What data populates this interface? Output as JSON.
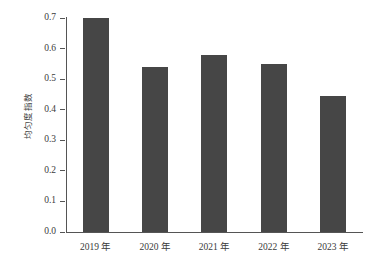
{
  "chart_data": {
    "type": "bar",
    "title": "",
    "subtitle": "",
    "xlabel": "",
    "ylabel": "均匀度指数",
    "categories": [
      "2019 年",
      "2020 年",
      "2021 年",
      "2022 年",
      "2023 年"
    ],
    "values": [
      0.7,
      0.54,
      0.58,
      0.55,
      0.445
    ],
    "series": [
      {
        "name": "均匀度指数",
        "values": [
          0.7,
          0.54,
          0.58,
          0.55,
          0.445
        ]
      }
    ],
    "ylim": [
      0.0,
      0.7
    ],
    "ytick_values": [
      0.0,
      0.1,
      0.2,
      0.3,
      0.4,
      0.5,
      0.6,
      0.7
    ],
    "ytick_labels": [
      "0.0",
      "0.1",
      "0.2",
      "0.3",
      "0.4",
      "0.5",
      "0.6",
      "0.7"
    ],
    "grid": false,
    "legend": false,
    "legend_position": "none",
    "bar_color": "#464646",
    "axis_color": "#555555",
    "text_color": "#3a3a3a",
    "background_color": "#ffffff"
  }
}
